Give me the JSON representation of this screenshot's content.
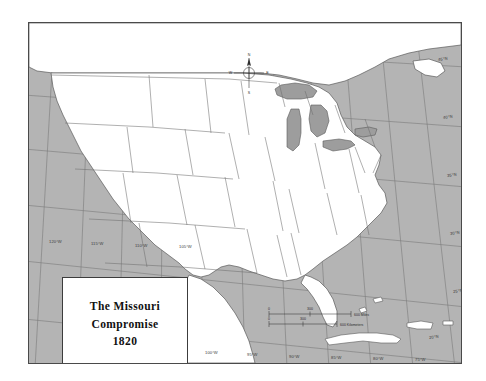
{
  "map": {
    "title_box": {
      "line1": "The Missouri",
      "line2": "Compromise",
      "line3": "1820"
    },
    "compass": {
      "north": "N",
      "east": "E",
      "south": "S",
      "west": "W"
    },
    "scale_bar": {
      "miles": {
        "start": "0",
        "mid": "300",
        "end": "600 Miles"
      },
      "kilometers": {
        "start": "0",
        "mid": "300",
        "end": "600 Kilometers"
      }
    },
    "longitude_labels_top": [
      "120°W",
      "115°W",
      "110°W",
      "105°W"
    ],
    "longitude_labels_bottom": [
      "100°W",
      "95°W",
      "90°W",
      "85°W",
      "80°W",
      "75°W"
    ],
    "latitude_labels_right": [
      "45°N",
      "40°N",
      "35°N",
      "30°N",
      "25°N",
      "20°N"
    ],
    "colors": {
      "ocean": "#b4b4b4",
      "land": "#ffffff",
      "lake": "#9d9d9d",
      "graticule": "#7a7a7a",
      "border": "#4a4a4a",
      "text": "#2d2d2d"
    }
  }
}
